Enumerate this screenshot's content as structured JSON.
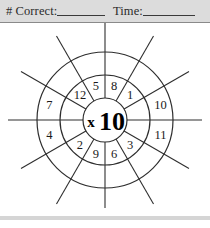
{
  "page": {
    "background_color": "#ffffff"
  },
  "header": {
    "background_color": "#dcdcdc",
    "rule_color": "#8a8a8a",
    "correct_label": "# Correct:",
    "correct_value": "",
    "time_label": "Time:",
    "time_value": ""
  },
  "wheel": {
    "center_operator": "x",
    "center_number": "10",
    "center_text": "x10",
    "sector_count": 12,
    "stroke_color": "#2e2e2e",
    "text_color": "#1a1a1a",
    "geometry": {
      "center_x": 105,
      "center_y": 97,
      "inner_radius": 22,
      "middle_radius": 45,
      "outer_radius": 68,
      "spoke_overshoot": 29
    },
    "sectors": [
      {
        "index": 0,
        "label": "8",
        "ring": "middle",
        "angle_deg": -75
      },
      {
        "index": 1,
        "label": "1",
        "ring": "middle",
        "angle_deg": -45
      },
      {
        "index": 2,
        "label": "10",
        "ring": "outer",
        "angle_deg": -15
      },
      {
        "index": 3,
        "label": "11",
        "ring": "outer",
        "angle_deg": 15
      },
      {
        "index": 4,
        "label": "3",
        "ring": "middle",
        "angle_deg": 45
      },
      {
        "index": 5,
        "label": "6",
        "ring": "middle",
        "angle_deg": 75
      },
      {
        "index": 6,
        "label": "9",
        "ring": "middle",
        "angle_deg": 105
      },
      {
        "index": 7,
        "label": "2",
        "ring": "middle",
        "angle_deg": 135
      },
      {
        "index": 8,
        "label": "4",
        "ring": "outer",
        "angle_deg": 165
      },
      {
        "index": 9,
        "label": "7",
        "ring": "outer",
        "angle_deg": 195
      },
      {
        "index": 10,
        "label": "12",
        "ring": "middle",
        "angle_deg": 225
      },
      {
        "index": 11,
        "label": "5",
        "ring": "middle",
        "angle_deg": 255
      }
    ]
  },
  "footer": {
    "rule_color": "#d5d5d5"
  }
}
